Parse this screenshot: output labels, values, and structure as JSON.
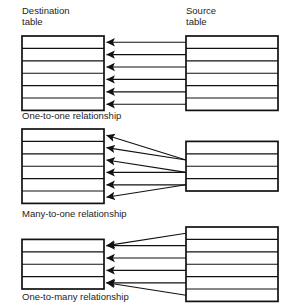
{
  "headers": {
    "destination": "Destination\ntable",
    "destination_line1": "Destination",
    "destination_line2": "table",
    "source_line1": "Source",
    "source_line2": "table"
  },
  "colors": {
    "stroke": "#111111",
    "fill": "#ffffff",
    "text": "#1d1d1d",
    "background": "#ffffff"
  },
  "sections": [
    {
      "id": "one-to-one",
      "caption": "One-to-one relationship",
      "destination_rows": 6,
      "source_rows": 6,
      "links": [
        {
          "source_row": 0,
          "dest_row": 0
        },
        {
          "source_row": 1,
          "dest_row": 1
        },
        {
          "source_row": 2,
          "dest_row": 2
        },
        {
          "source_row": 3,
          "dest_row": 3
        },
        {
          "source_row": 4,
          "dest_row": 4
        },
        {
          "source_row": 5,
          "dest_row": 5
        }
      ]
    },
    {
      "id": "many-to-one",
      "caption": "Many-to-one relationship",
      "destination_rows": 6,
      "source_rows": 4,
      "links": [
        {
          "source_row": 1,
          "dest_row": 0
        },
        {
          "source_row": 1,
          "dest_row": 1
        },
        {
          "source_row": 2,
          "dest_row": 2
        },
        {
          "source_row": 2,
          "dest_row": 3
        },
        {
          "source_row": 3,
          "dest_row": 4
        },
        {
          "source_row": 3,
          "dest_row": 5
        }
      ]
    },
    {
      "id": "one-to-many",
      "caption": "One-to-many relationship",
      "destination_rows": 4,
      "source_rows": 6,
      "links": [
        {
          "source_row": 0,
          "dest_row": 0
        },
        {
          "source_row": 1,
          "dest_row": 0
        },
        {
          "source_row": 2,
          "dest_row": 1
        },
        {
          "source_row": 3,
          "dest_row": 2
        },
        {
          "source_row": 4,
          "dest_row": 3
        },
        {
          "source_row": 5,
          "dest_row": 3
        }
      ]
    }
  ],
  "layout": {
    "dest_x": 22,
    "dest_width": 82,
    "src_x": 186,
    "src_width": 92,
    "row_height": 12.4,
    "arrow_tip_x": 106,
    "sections_top": [
      36,
      129,
      227
    ]
  }
}
